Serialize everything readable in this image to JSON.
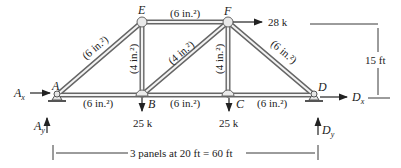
{
  "nodes": {
    "A": {
      "label": "A",
      "x": 57,
      "y": 95
    },
    "B": {
      "label": "B",
      "x": 142,
      "y": 95
    },
    "C": {
      "label": "C",
      "x": 228,
      "y": 95
    },
    "D": {
      "label": "D",
      "x": 314,
      "y": 95
    },
    "E": {
      "label": "E",
      "x": 142,
      "y": 22
    },
    "F": {
      "label": "F",
      "x": 228,
      "y": 22
    }
  },
  "members": [
    {
      "id": "AE",
      "area": "(6 in.²)"
    },
    {
      "id": "EF",
      "area": "(6 in.²)"
    },
    {
      "id": "FD",
      "area": "(6 in.²)"
    },
    {
      "id": "AB",
      "area": "(6 in.²)"
    },
    {
      "id": "BC",
      "area": "(6 in.²)"
    },
    {
      "id": "CD",
      "area": "(6 in.²)"
    },
    {
      "id": "EB",
      "area": "(4 in.²)"
    },
    {
      "id": "BF",
      "area": "(4 in.²)"
    },
    {
      "id": "FC",
      "area": "(4 in.²)"
    }
  ],
  "loads": {
    "F_horizontal": "28 k",
    "B_vertical": "25 k",
    "C_vertical": "25 k"
  },
  "reactions": {
    "Ax": "A",
    "Ax_sub": "x",
    "Ay": "A",
    "Ay_sub": "y",
    "Dx": "D",
    "Dx_sub": "x",
    "Dy": "D",
    "Dy_sub": "y"
  },
  "dimensions": {
    "height": "15 ft",
    "span": "3 panels at 20 ft = 60 ft"
  },
  "colors": {
    "member_outline": "#555555",
    "member_fill": "#e8e8e8",
    "ink": "#222222"
  }
}
